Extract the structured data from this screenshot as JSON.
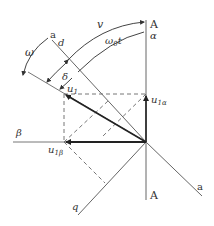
{
  "diagram": {
    "title": "",
    "labels": {
      "axis_A_top": "A",
      "axis_alpha": "α",
      "axis_A_bottom": "A",
      "axis_beta": "β",
      "axis_a_top": "a",
      "axis_a_bottom": "a",
      "axis_d": "d",
      "axis_q": "q",
      "omega": "ω",
      "v": "v",
      "omega0t_main": "ω",
      "omega0t_sub": "0",
      "omega0t_t": "t",
      "delta": "δ",
      "u1_main": "u",
      "u1_sub": "1",
      "u1alpha_main": "u",
      "u1alpha_sub": "1α",
      "u1beta_main": "u",
      "u1beta_sub": "1β"
    },
    "colors": {
      "line": "#555555",
      "vector": "#222222",
      "dashed": "#666666",
      "text": "#333333"
    }
  }
}
